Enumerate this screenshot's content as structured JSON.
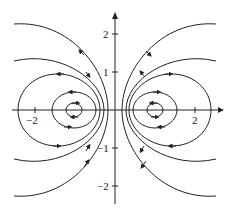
{
  "figure": {
    "type": "phase-portrait",
    "stroke_color": "#222222",
    "background": "#ffffff"
  },
  "axes": {
    "x_ticks": [
      {
        "value": -2,
        "label": "−2"
      },
      {
        "value": 2,
        "label": "2"
      }
    ],
    "y_ticks": [
      {
        "value": 2,
        "label": "2"
      },
      {
        "value": 1,
        "label": "1"
      },
      {
        "value": -1,
        "label": "−1"
      },
      {
        "value": -2,
        "label": "−2"
      }
    ],
    "x_range": [
      -2.7,
      2.7
    ],
    "y_range": [
      -2.5,
      2.5
    ]
  },
  "centers": [
    {
      "x": -1,
      "y": 0
    },
    {
      "x": 1,
      "y": 0
    }
  ]
}
